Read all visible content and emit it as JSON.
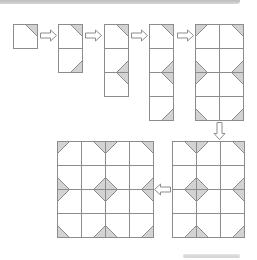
{
  "diagram": {
    "cell_size": 24,
    "colors": {
      "background": "#ffffff",
      "line": "#8c8c8c",
      "shade": "#d3d3d3",
      "arrow_fill": "#ffffff"
    },
    "steps": [
      {
        "id": "step-1",
        "x": 13,
        "y": 24,
        "cols": 1,
        "rows": 1,
        "shapes": [
          {
            "type": "corner",
            "corner": "top-right",
            "cx": 37,
            "cy": 24
          }
        ]
      },
      {
        "id": "step-2",
        "x": 58,
        "y": 24,
        "cols": 1,
        "rows": 2,
        "shapes": [
          {
            "type": "corner",
            "corner": "top-right",
            "cx": 82,
            "cy": 24
          },
          {
            "type": "corner",
            "corner": "bottom-right",
            "cx": 82,
            "cy": 72
          }
        ]
      },
      {
        "id": "step-3",
        "x": 104,
        "y": 24,
        "cols": 1,
        "rows": 3,
        "shapes": [
          {
            "type": "corner",
            "corner": "top-right",
            "cx": 128,
            "cy": 24
          },
          {
            "type": "edge",
            "side": "right",
            "cx": 128,
            "cy": 72
          }
        ]
      },
      {
        "id": "step-4",
        "x": 149,
        "y": 24,
        "cols": 1,
        "rows": 4,
        "shapes": [
          {
            "type": "corner",
            "corner": "top-right",
            "cx": 173,
            "cy": 24
          },
          {
            "type": "edge",
            "side": "right",
            "cx": 173,
            "cy": 72
          },
          {
            "type": "corner",
            "corner": "bottom-right",
            "cx": 173,
            "cy": 120
          }
        ]
      },
      {
        "id": "step-5",
        "x": 195,
        "y": 24,
        "cols": 2,
        "rows": 4,
        "shapes": [
          {
            "type": "corner",
            "corner": "top-left",
            "cx": 195,
            "cy": 24
          },
          {
            "type": "corner",
            "corner": "top-right",
            "cx": 243,
            "cy": 24
          },
          {
            "type": "edge",
            "side": "left",
            "cx": 195,
            "cy": 72
          },
          {
            "type": "edge",
            "side": "right",
            "cx": 243,
            "cy": 72
          },
          {
            "type": "corner",
            "corner": "bottom-left",
            "cx": 195,
            "cy": 120
          },
          {
            "type": "corner",
            "corner": "bottom-right",
            "cx": 243,
            "cy": 120
          }
        ]
      },
      {
        "id": "step-6",
        "x": 172,
        "y": 141,
        "cols": 3,
        "rows": 4,
        "shapes": [
          {
            "type": "edge",
            "side": "top",
            "cx": 196,
            "cy": 141
          },
          {
            "type": "corner",
            "corner": "top-right",
            "cx": 244,
            "cy": 141
          },
          {
            "type": "diamond",
            "cx": 196,
            "cy": 189
          },
          {
            "type": "edge",
            "side": "right",
            "cx": 244,
            "cy": 189
          },
          {
            "type": "edge",
            "side": "bottom",
            "cx": 196,
            "cy": 237
          },
          {
            "type": "corner",
            "corner": "bottom-right",
            "cx": 244,
            "cy": 237
          }
        ]
      },
      {
        "id": "step-7",
        "x": 57,
        "y": 141,
        "cols": 4,
        "rows": 4,
        "shapes": [
          {
            "type": "corner",
            "corner": "top-left",
            "cx": 57,
            "cy": 141
          },
          {
            "type": "edge",
            "side": "top",
            "cx": 105,
            "cy": 141
          },
          {
            "type": "corner",
            "corner": "top-right",
            "cx": 153,
            "cy": 141
          },
          {
            "type": "edge",
            "side": "left",
            "cx": 57,
            "cy": 189
          },
          {
            "type": "diamond",
            "cx": 105,
            "cy": 189
          },
          {
            "type": "edge",
            "side": "right",
            "cx": 153,
            "cy": 189
          },
          {
            "type": "corner",
            "corner": "bottom-left",
            "cx": 57,
            "cy": 237
          },
          {
            "type": "edge",
            "side": "bottom",
            "cx": 105,
            "cy": 237
          },
          {
            "type": "corner",
            "corner": "bottom-right",
            "cx": 153,
            "cy": 237
          }
        ]
      }
    ],
    "arrows": [
      {
        "id": "arrow-1-2",
        "direction": "right",
        "x": 40,
        "y": 35,
        "length": 16
      },
      {
        "id": "arrow-2-3",
        "direction": "right",
        "x": 85,
        "y": 35,
        "length": 16
      },
      {
        "id": "arrow-3-4",
        "direction": "right",
        "x": 131,
        "y": 35,
        "length": 16
      },
      {
        "id": "arrow-4-5",
        "direction": "right",
        "x": 177,
        "y": 35,
        "length": 16
      },
      {
        "id": "arrow-5-6",
        "direction": "down",
        "x": 219,
        "y": 122,
        "length": 17
      },
      {
        "id": "arrow-6-7",
        "direction": "left",
        "x": 170,
        "y": 189,
        "length": 16
      }
    ]
  }
}
